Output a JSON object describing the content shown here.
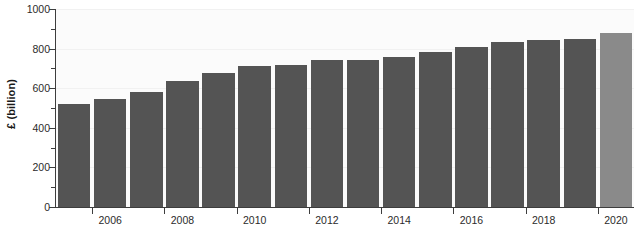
{
  "chart_data": {
    "type": "bar",
    "title": "",
    "subtitle": "",
    "xlabel": "",
    "ylabel": "£ (billion)",
    "ylim": [
      0,
      1000
    ],
    "ytick_interval": 200,
    "yminor_interval": 100,
    "grid": true,
    "legend": null,
    "categories": [
      "2005",
      "2006",
      "2007",
      "2008",
      "2009",
      "2010",
      "2011",
      "2012",
      "2013",
      "2014",
      "2015",
      "2016",
      "2017",
      "2018",
      "2019",
      "2020"
    ],
    "values": [
      520,
      545,
      580,
      635,
      675,
      710,
      715,
      740,
      745,
      760,
      785,
      810,
      835,
      845,
      850,
      880
    ],
    "ytick_labels": [
      "0",
      "200",
      "400",
      "600",
      "800",
      "1000"
    ],
    "ytick_values": [
      0,
      200,
      400,
      600,
      800,
      1000
    ],
    "yminor_values": [
      100,
      300,
      500,
      700,
      900
    ],
    "xtick_labels": [
      "2006",
      "2008",
      "2010",
      "2012",
      "2014",
      "2016",
      "2018",
      "2020"
    ],
    "xtick_categories": [
      "2006",
      "2008",
      "2010",
      "2012",
      "2014",
      "2016",
      "2018",
      "2020"
    ],
    "bar_colors": [
      "#545454",
      "#545454",
      "#545454",
      "#545454",
      "#545454",
      "#545454",
      "#545454",
      "#545454",
      "#545454",
      "#545454",
      "#545454",
      "#545454",
      "#545454",
      "#545454",
      "#545454",
      "#8a8a8a"
    ],
    "colors": {
      "bar_default": "#545454",
      "bar_highlight": "#8a8a8a",
      "plot_background": "#fbfbfb",
      "gridline": "#f1f1f1",
      "axis": "#3d3d3d",
      "text": "#2b2b2b"
    }
  }
}
